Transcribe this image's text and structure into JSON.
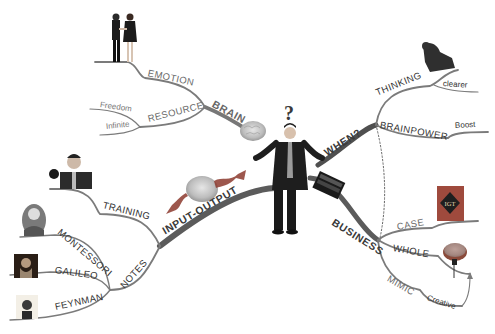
{
  "diagram": {
    "type": "mind-map",
    "palette": {
      "branch": "#6b6b6b",
      "branch_dark": "#4a4a4a",
      "text": "#555555",
      "background": "#ffffff",
      "accent_red": "#b3392c"
    },
    "center": {
      "label": "?",
      "image": "businessman-shrugging"
    },
    "branches": {
      "brain": {
        "label": "BRAIN",
        "icon": "brain-icon",
        "children": [
          {
            "label": "EMOTION",
            "image": "handshake-couple"
          },
          {
            "label": "RESOURCE",
            "children": [
              {
                "label": "Freedom"
              },
              {
                "label": "Infinite"
              }
            ]
          }
        ]
      },
      "when": {
        "label": "WHEN?",
        "children": [
          {
            "label": "THINKING",
            "image": "thinker-statue",
            "children": [
              {
                "label": "clearer"
              }
            ]
          },
          {
            "label": "BRAINPOWER",
            "children": [
              {
                "label": "Boost"
              }
            ]
          }
        ]
      },
      "input_output": {
        "label": "INPUT-OUTPUT",
        "icon": "brain-with-arrows-icon",
        "children": [
          {
            "label": "TRAINING",
            "image": "boxer"
          },
          {
            "label": "NOTES",
            "children": [
              {
                "label": "MONTESSORI",
                "image": "portrait-montessori"
              },
              {
                "label": "GALILEO",
                "image": "portrait-galileo"
              },
              {
                "label": "FEYNMAN",
                "image": "portrait-feynman"
              }
            ]
          }
        ]
      },
      "business": {
        "label": "BUSINESS",
        "icon": "laptop-icon",
        "children": [
          {
            "label": "CASE",
            "image": "igt-logo",
            "logo_text": "IGT"
          },
          {
            "label": "WHOLE",
            "icon": "brain-icon"
          },
          {
            "label": "MIMIC",
            "children": [
              {
                "label": "Creative"
              }
            ]
          }
        ]
      }
    }
  }
}
